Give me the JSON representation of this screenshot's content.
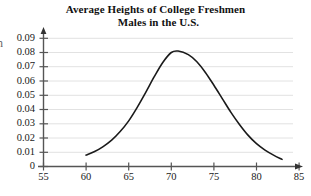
{
  "chart_data": {
    "type": "line",
    "title": "Average Heights of College Freshmen Males in the U.S.",
    "title_line1": "Average Heights of College Freshmen",
    "title_line2": "Males in the U.S.",
    "xlabel": "",
    "ylabel": "",
    "xlim": [
      55,
      85
    ],
    "ylim": [
      0,
      0.09
    ],
    "grid": true,
    "legend": null,
    "x_ticks": [
      55,
      60,
      65,
      70,
      75,
      80,
      85
    ],
    "x_tick_labels": [
      "55",
      "60",
      "65",
      "70",
      "75",
      "80",
      "85"
    ],
    "y_ticks": [
      0,
      0.01,
      0.02,
      0.03,
      0.04,
      0.05,
      0.06,
      0.07,
      0.08,
      0.09
    ],
    "y_tick_labels": [
      "0",
      "0.01",
      "0.02",
      "0.03",
      "0.04",
      "0.05",
      "0.06",
      "0.07",
      "0.08",
      "0.09"
    ],
    "series": [
      {
        "name": "height distribution",
        "color": "#1a1a1a",
        "x": [
          60.0,
          61.0,
          62.0,
          63.0,
          64.0,
          65.0,
          66.0,
          67.0,
          68.0,
          69.0,
          70.0,
          70.8,
          72.0,
          73.0,
          74.0,
          75.0,
          76.0,
          77.0,
          78.0,
          79.0,
          80.0,
          81.0,
          82.0,
          83.0
        ],
        "y": [
          0.008,
          0.0105,
          0.014,
          0.0185,
          0.0245,
          0.032,
          0.0415,
          0.052,
          0.063,
          0.073,
          0.08,
          0.081,
          0.0785,
          0.0735,
          0.066,
          0.057,
          0.0475,
          0.038,
          0.0295,
          0.022,
          0.016,
          0.0115,
          0.008,
          0.005
        ]
      }
    ],
    "annotations": {
      "peak_x": 70.8,
      "peak_y": 0.081,
      "curve_start_x": 60,
      "curve_end_x": 83,
      "edge_fragment": "n"
    },
    "colors": {
      "curve": "#1a1a1a",
      "axis": "#555555",
      "grid": "#e2e2e2",
      "text": "#111111",
      "background": "#ffffff"
    }
  }
}
